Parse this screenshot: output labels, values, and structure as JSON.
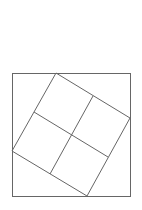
{
  "diagram": {
    "title": "",
    "stroke_color": "#666666",
    "background_color": "#ffffff",
    "outer_square": {
      "x": 12,
      "y": 73,
      "width": 118,
      "height": 123
    },
    "rotated_square": {
      "vertices": [
        {
          "name": "top",
          "x": 56,
          "y": 73
        },
        {
          "name": "right",
          "x": 130,
          "y": 118
        },
        {
          "name": "bottom",
          "x": 87,
          "y": 196
        },
        {
          "name": "left",
          "x": 12,
          "y": 151
        }
      ]
    },
    "grid_lines": [
      {
        "name": "midline-a",
        "x1": 34,
        "y1": 112,
        "x2": 108,
        "y2": 157
      },
      {
        "name": "midline-b",
        "x1": 93,
        "y1": 96,
        "x2": 50,
        "y2": 174
      }
    ]
  }
}
